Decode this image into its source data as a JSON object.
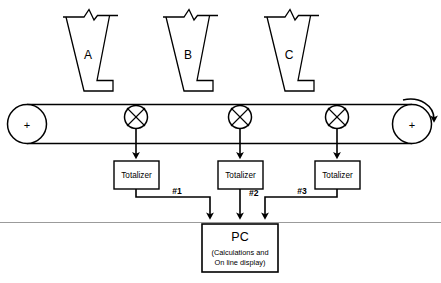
{
  "diagram": {
    "type": "process-flow-schematic",
    "colors": {
      "line": "#000000",
      "background": "#ffffff",
      "rule": "#9b9b9b"
    },
    "hoppers": [
      {
        "id": "A",
        "label": "A",
        "name": "hopper-a"
      },
      {
        "id": "B",
        "label": "B",
        "name": "hopper-b"
      },
      {
        "id": "C",
        "label": "C",
        "name": "hopper-c"
      }
    ],
    "pulleys": [
      {
        "id": "left",
        "label": "+",
        "name": "pulley-left"
      },
      {
        "id": "right",
        "label": "+",
        "name": "pulley-right"
      }
    ],
    "rotation": {
      "direction": "clockwise",
      "icon": "curved-arrow-icon"
    },
    "sensors": [
      {
        "id": "s1",
        "icon": "crossed-circle-icon",
        "label": ""
      },
      {
        "id": "s2",
        "icon": "crossed-circle-icon",
        "label": ""
      },
      {
        "id": "s3",
        "icon": "crossed-circle-icon",
        "label": ""
      }
    ],
    "totalizers": [
      {
        "id": "t1",
        "label": "Totalizer"
      },
      {
        "id": "t2",
        "label": "Totalizer"
      },
      {
        "id": "t3",
        "label": "Totalizer"
      }
    ],
    "signals": [
      {
        "id": "w1",
        "label": "#1"
      },
      {
        "id": "w2",
        "label": "#2"
      },
      {
        "id": "w3",
        "label": "#3"
      }
    ],
    "pc": {
      "title": "PC",
      "line1": "(Calculations and",
      "line2": "On line display)"
    }
  }
}
